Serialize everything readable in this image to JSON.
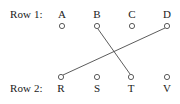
{
  "figure": {
    "width": 180,
    "height": 104,
    "background_color": "#ffffff",
    "ink_color": "#1a1a1a",
    "stroke_color": "#4a4a4a"
  },
  "rows": [
    {
      "id": "row1",
      "label": "Row 1:",
      "label_x": 10,
      "label_y": 9,
      "letter_y": 9,
      "circle_y": 26,
      "nodes": [
        {
          "id": "A",
          "label": "A",
          "x": 62
        },
        {
          "id": "B",
          "label": "B",
          "x": 97
        },
        {
          "id": "C",
          "label": "C",
          "x": 132
        },
        {
          "id": "D",
          "label": "D",
          "x": 167
        }
      ]
    },
    {
      "id": "row2",
      "label": "Row 2:",
      "label_x": 10,
      "label_y": 83,
      "letter_y": 83,
      "circle_y": 77,
      "nodes": [
        {
          "id": "R",
          "label": "R",
          "x": 61
        },
        {
          "id": "S",
          "label": "S",
          "x": 97
        },
        {
          "id": "T",
          "label": "T",
          "x": 131
        },
        {
          "id": "V",
          "label": "V",
          "x": 167
        }
      ]
    }
  ],
  "circle_radius": 2.6,
  "edges": [
    {
      "id": "edge-B-T",
      "from": "B",
      "to": "T",
      "x1": 98,
      "y1": 29,
      "x2": 130,
      "y2": 74
    },
    {
      "id": "edge-D-R",
      "from": "D",
      "to": "R",
      "x1": 165,
      "y1": 28,
      "x2": 63,
      "y2": 75
    }
  ]
}
